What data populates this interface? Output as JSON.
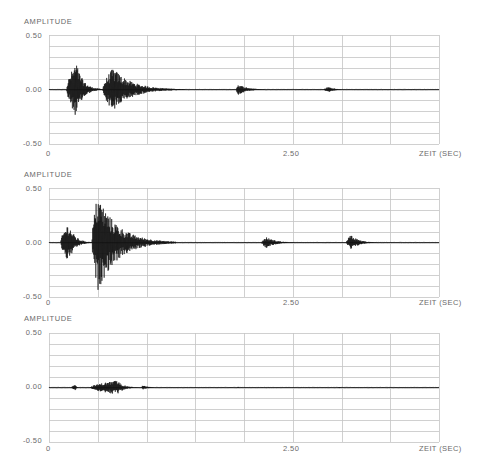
{
  "chart_data": [
    {
      "type": "line",
      "subtype": "waveform",
      "title": "",
      "ylabel": "AMPLITUDE",
      "xlabel": "ZEIT (SEC)",
      "ylim": [
        -0.5,
        0.5
      ],
      "xlim": [
        0,
        4.0
      ],
      "y_ticks": [
        "0.50",
        "0.00",
        "-0.50"
      ],
      "x_ticks": [
        "0",
        "2.50"
      ],
      "grid": {
        "vertical_step_sec": 0.5,
        "horizontal_divisions": 10
      },
      "bursts": [
        {
          "start": 0.18,
          "peak": 0.28,
          "end": 0.55,
          "amplitude": 0.25
        },
        {
          "start": 0.55,
          "peak": 0.66,
          "end": 1.4,
          "amplitude": 0.2
        },
        {
          "start": 1.92,
          "peak": 1.94,
          "end": 2.3,
          "amplitude": 0.05
        },
        {
          "start": 2.82,
          "peak": 2.87,
          "end": 3.1,
          "amplitude": 0.025
        }
      ]
    },
    {
      "type": "line",
      "subtype": "waveform",
      "title": "",
      "ylabel": "AMPLITUDE",
      "xlabel": "ZEIT (SEC)",
      "ylim": [
        -0.5,
        0.5
      ],
      "xlim": [
        0,
        4.0
      ],
      "y_ticks": [
        "0.50",
        "0.00",
        "-0.50"
      ],
      "x_ticks": [
        "0",
        "2.50"
      ],
      "grid": {
        "vertical_step_sec": 0.5,
        "horizontal_divisions": 10
      },
      "bursts": [
        {
          "start": 0.12,
          "peak": 0.2,
          "end": 0.45,
          "amplitude": 0.18
        },
        {
          "start": 0.44,
          "peak": 0.5,
          "end": 1.3,
          "amplitude": 0.45
        },
        {
          "start": 2.18,
          "peak": 2.23,
          "end": 2.6,
          "amplitude": 0.05
        },
        {
          "start": 3.05,
          "peak": 3.1,
          "end": 3.4,
          "amplitude": 0.07
        }
      ]
    },
    {
      "type": "line",
      "subtype": "waveform",
      "title": "",
      "ylabel": "AMPLITUDE",
      "xlabel": "ZEIT (SEC)",
      "ylim": [
        -0.5,
        0.5
      ],
      "xlim": [
        0,
        4.0
      ],
      "y_ticks": [
        "0.50",
        "0.00",
        "-0.50"
      ],
      "x_ticks": [
        "0",
        "2.50"
      ],
      "grid": {
        "vertical_step_sec": 0.5,
        "horizontal_divisions": 10
      },
      "bursts": [
        {
          "start": 0.23,
          "peak": 0.27,
          "end": 0.32,
          "amplitude": 0.025
        },
        {
          "start": 0.42,
          "peak": 0.7,
          "end": 0.95,
          "amplitude": 0.065
        },
        {
          "start": 0.95,
          "peak": 0.96,
          "end": 1.2,
          "amplitude": 0.02
        },
        {
          "start": 1.93,
          "peak": 1.94,
          "end": 1.97,
          "amplitude": 0.006
        },
        {
          "start": 2.96,
          "peak": 2.98,
          "end": 3.02,
          "amplitude": 0.006
        }
      ]
    }
  ],
  "panels": [
    {
      "ylabel": "AMPLITUDE",
      "y_top": "0.50",
      "y_mid": "0.00",
      "y_bottom": "-0.50",
      "x_start": "0",
      "x_mid": "2.50",
      "x_label": "ZEIT (SEC)"
    },
    {
      "ylabel": "AMPLITUDE",
      "y_top": "0.50",
      "y_mid": "0.00",
      "y_bottom": "-0.50",
      "x_start": "0",
      "x_mid": "2.50",
      "x_label": "ZEIT (SEC)"
    },
    {
      "ylabel": "AMPLITUDE",
      "y_top": "0.50",
      "y_mid": "0.00",
      "y_bottom": "-0.50",
      "x_start": "0",
      "x_mid": "2.50",
      "x_label": "ZEIT (SEC)"
    }
  ],
  "colors": {
    "grid": "#c4c4c4",
    "waveform": "#111111",
    "text": "#6a6a6a"
  }
}
